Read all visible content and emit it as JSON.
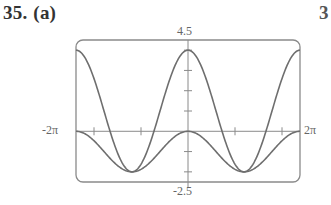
{
  "problem": {
    "number": "35.",
    "part": "(a)",
    "next_number_fragment": "3"
  },
  "chart_data": {
    "type": "line",
    "title": "",
    "xlabel": "",
    "ylabel": "",
    "xlim_labels": [
      "-2π",
      "2π"
    ],
    "ylim_labels": [
      "-2.5",
      "4.5"
    ],
    "xlim": [
      -6.2832,
      6.2832
    ],
    "ylim": [
      -2.5,
      4.5
    ],
    "y_tick_step": 1,
    "x_ticks_px": [
      94,
      141,
      235,
      282
    ],
    "grid": false,
    "legend": null,
    "series": [
      {
        "name": "f(x) = 1 + 3cos x",
        "expr": "1+3*cos(x)"
      },
      {
        "name": "g(x) = cos x - 1",
        "expr": "cos(x)-1"
      }
    ]
  },
  "colors": {
    "curve": "#6e6e6e",
    "frame": "#8a8a8a",
    "axis": "#8a8a8a"
  }
}
